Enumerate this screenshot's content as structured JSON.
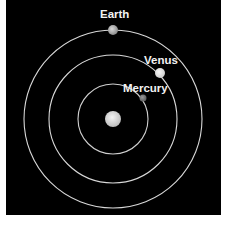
{
  "diagram": {
    "background": "#000000",
    "orbit_color": "#d8d8d8",
    "sun": {
      "name": "Sun",
      "color": "#e6e6e6"
    },
    "planets": [
      {
        "name": "Mercury",
        "label": "Mercury",
        "color": "#7a7a7a"
      },
      {
        "name": "Venus",
        "label": "Venus",
        "color": "#e8e8e8"
      },
      {
        "name": "Earth",
        "label": "Earth",
        "color": "#b8b8b8"
      }
    ]
  }
}
